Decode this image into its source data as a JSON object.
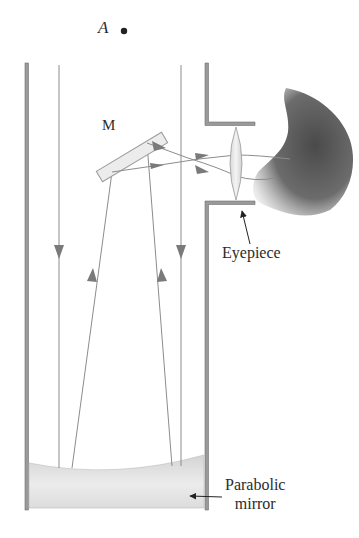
{
  "diagram": {
    "labels": {
      "point_a": "A",
      "secondary_mirror": "M",
      "eyepiece": "Eyepiece",
      "primary_mirror_line1": "Parabolic",
      "primary_mirror_line2": "mirror"
    },
    "components": [
      {
        "id": "tube",
        "label": "telescope tube"
      },
      {
        "id": "secondary-mirror",
        "label": "M"
      },
      {
        "id": "eyepiece-lens",
        "label": "Eyepiece"
      },
      {
        "id": "primary-mirror",
        "label": "Parabolic mirror"
      },
      {
        "id": "observer-head",
        "label": "observer"
      },
      {
        "id": "point-a",
        "label": "A"
      }
    ],
    "colors": {
      "tube_wall": "#8a8a8a",
      "ray": "#8c8c8c",
      "arrow": "#7a7a7a",
      "mirror_fill": "#e6e6e6",
      "head": "#5f5f5f",
      "text": "#2b2b2b"
    }
  }
}
